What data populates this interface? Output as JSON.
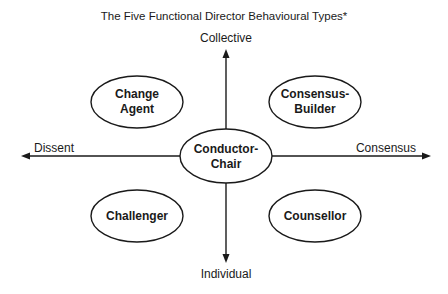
{
  "title": "The Five Functional Director Behavioural Types*",
  "axes": {
    "top": "Collective",
    "bottom": "Individual",
    "left": "Dissent",
    "right": "Consensus"
  },
  "nodes": {
    "top_left": {
      "line1": "Change",
      "line2": "Agent"
    },
    "top_right": {
      "line1": "Consensus-",
      "line2": "Builder"
    },
    "center": {
      "line1": "Conductor-",
      "line2": "Chair"
    },
    "bottom_left": {
      "line1": "Challenger"
    },
    "bottom_right": {
      "line1": "Counsellor"
    }
  },
  "colors": {
    "stroke": "#1a1a1a",
    "fill": "#ffffff",
    "background": "#ffffff"
  }
}
